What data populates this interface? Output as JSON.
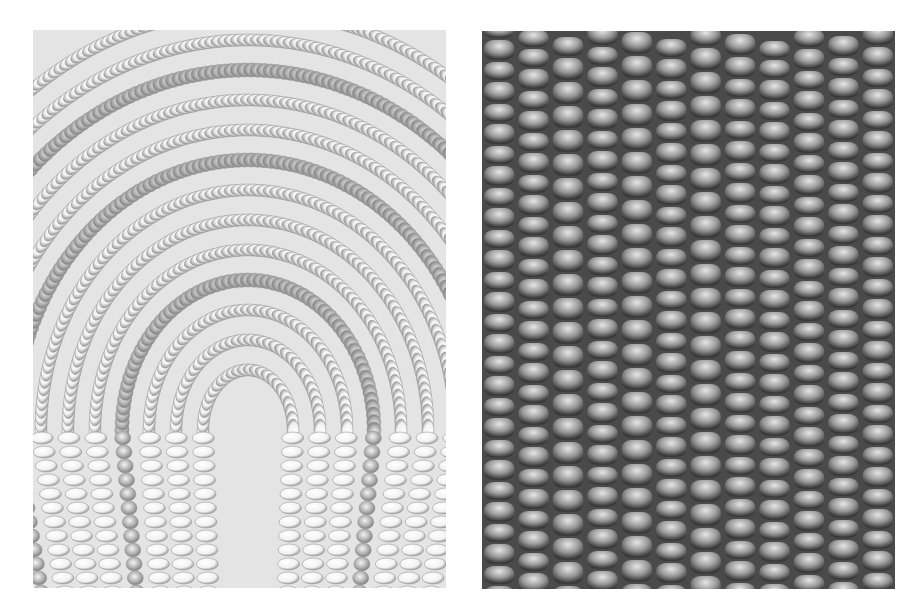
{
  "figure": {
    "panels": [
      {
        "id": "left",
        "subject": "white seed beads sewn in concentric arched rows with faceted metallic beads",
        "tone": "light grayscale",
        "background_color": "#e4e4e4",
        "bead_color": "#f2f2f2",
        "shadow_color": "#8a8a8a",
        "faceted_bead_color": "#b5b5b5"
      },
      {
        "id": "right",
        "subject": "close-up of rounded beads in vertical columns",
        "tone": "mid grayscale",
        "background_color": "#4a4a4a",
        "bead_highlight_color": "#e6e6e6",
        "bead_mid_color": "#9a9a9a",
        "bead_shadow_color": "#3a3a3a",
        "columns": 12
      }
    ]
  }
}
